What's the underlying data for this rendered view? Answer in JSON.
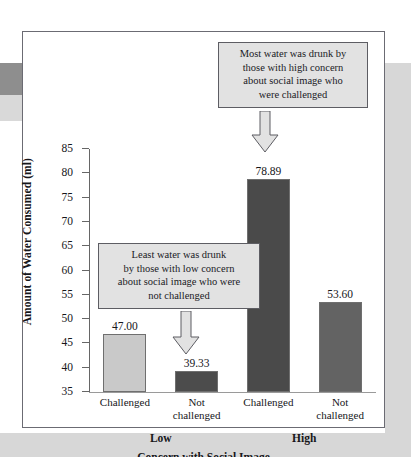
{
  "chart_data": {
    "type": "bar",
    "title": "",
    "xlabel": "Concern with Social Image",
    "ylabel": "Amount of Water Consumed (ml)",
    "ylim": [
      35,
      85
    ],
    "ytick_values": [
      35,
      40,
      45,
      50,
      55,
      60,
      65,
      70,
      75,
      80,
      85
    ],
    "ytick_labels": [
      "35",
      "40",
      "45",
      "50",
      "55",
      "60",
      "65",
      "70",
      "75",
      "80",
      "85"
    ],
    "grid": false,
    "legend": "none",
    "groups": [
      {
        "label": "Low"
      },
      {
        "label": "High"
      }
    ],
    "categories": [
      "Challenged",
      "Not challenged",
      "Challenged",
      "Not challenged"
    ],
    "category_lines": [
      [
        "Challenged"
      ],
      [
        "Not",
        "challenged"
      ],
      [
        "Challenged"
      ],
      [
        "Not",
        "challenged"
      ]
    ],
    "values": [
      47.0,
      39.33,
      78.89,
      53.6
    ],
    "value_labels": [
      "47.00",
      "39.33",
      "78.89",
      "53.60"
    ],
    "bar_colors": [
      "#c9c9c9",
      "#4c4c4c",
      "#4a4a4a",
      "#636363"
    ],
    "annotations": [
      {
        "id": "high-challenged-callout",
        "lines": [
          "Most water was drunk by",
          "those with high concern",
          "about social image who",
          "were challenged"
        ],
        "points_to": "78.89"
      },
      {
        "id": "low-not-challenged-callout",
        "lines": [
          "Least water was drunk",
          "by those with low concern",
          "about social image who were",
          "not challenged"
        ],
        "points_to": "39.33"
      }
    ]
  }
}
